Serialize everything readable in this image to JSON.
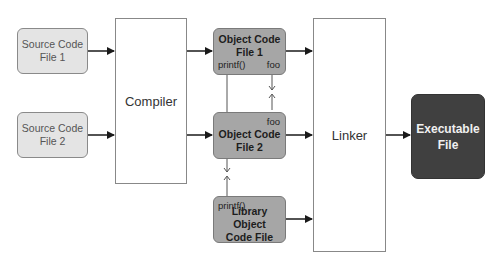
{
  "diagram": {
    "nodes": {
      "source1": {
        "label": "Source Code\nFile 1"
      },
      "source2": {
        "label": "Source Code\nFile 2"
      },
      "compiler": {
        "label": "Compiler"
      },
      "object1": {
        "label": "Object Code\nFile 1",
        "port_left": "printf()",
        "port_right": "foo"
      },
      "object2": {
        "label": "Object Code\nFile 2",
        "port_right": "foo"
      },
      "library": {
        "label": "Library Object\nCode File",
        "port_left": "printf()"
      },
      "linker": {
        "label": "Linker"
      },
      "executable": {
        "label": "Executable\nFile"
      }
    },
    "edges": [
      {
        "from": "source1",
        "to": "compiler"
      },
      {
        "from": "source2",
        "to": "compiler"
      },
      {
        "from": "compiler",
        "to": "object1"
      },
      {
        "from": "compiler",
        "to": "object2"
      },
      {
        "from": "object1",
        "to": "linker"
      },
      {
        "from": "object2",
        "to": "linker"
      },
      {
        "from": "library",
        "to": "linker"
      },
      {
        "from": "linker",
        "to": "executable"
      },
      {
        "from": "object1.foo",
        "to": "object2.foo",
        "style": "reference"
      },
      {
        "from": "object1.printf()",
        "to": "library.printf()",
        "style": "reference"
      }
    ],
    "colors": {
      "source_fill": "#e4e4e4",
      "object_fill": "#a6a6a6",
      "executable_fill": "#404040",
      "arrow": "#1a1a1a"
    }
  }
}
